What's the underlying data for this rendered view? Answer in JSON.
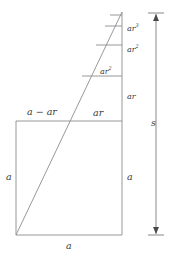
{
  "figure": {
    "stroke_color": "#8c8c8c",
    "text_color": "#3a3a3a",
    "background": "#ffffff",
    "width": 169,
    "height": 259
  },
  "labels": {
    "square_left_side": "a",
    "square_bottom": "a",
    "square_right_side": "a",
    "top_left_segment": "a − ar",
    "top_right_segment": "ar",
    "step_1": "ar",
    "step_2": "ar",
    "step_3": "ar",
    "step_4": "ar",
    "total": "s"
  },
  "exponents": {
    "step_2_exp": "2",
    "step_3_exp": "2",
    "step_4_exp": "3"
  },
  "geometry": {
    "square": {
      "left": 16,
      "top": 121,
      "right": 122,
      "bottom": 235
    },
    "apex": {
      "x": 122,
      "y": 12
    },
    "diagonal_start": {
      "x": 16,
      "y": 235
    },
    "vertical_axis_x": 122,
    "dimension_line_x": 156,
    "dimension_top_y": 13,
    "dimension_bottom_y": 235,
    "step_lines_y": [
      121,
      76,
      45,
      26,
      15
    ]
  }
}
